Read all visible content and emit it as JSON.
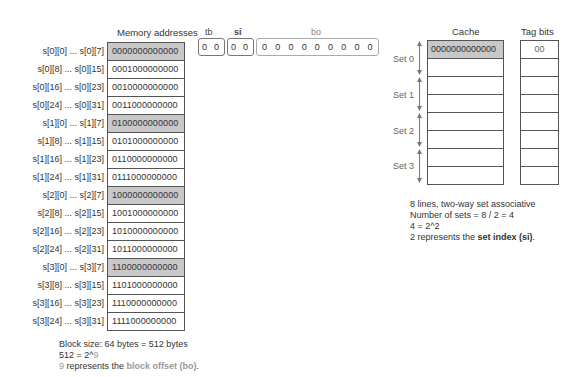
{
  "memory": {
    "title": "Memory addresses",
    "rows": [
      {
        "label": "s[0][0] ... s[0][7]",
        "address": "0000000000000",
        "highlight": true
      },
      {
        "label": "s[0][8] ... s[0][15]",
        "address": "0001000000000",
        "highlight": false
      },
      {
        "label": "s[0][16] ... s[0][23]",
        "address": "0010000000000",
        "highlight": false
      },
      {
        "label": "s[0][24] ... s[0][31]",
        "address": "0011000000000",
        "highlight": false
      },
      {
        "label": "s[1][0] ... s[1][7]",
        "address": "0100000000000",
        "highlight": true
      },
      {
        "label": "s[1][8] ... s[1][15]",
        "address": "0101000000000",
        "highlight": false
      },
      {
        "label": "s[1][16] ... s[1][23]",
        "address": "0110000000000",
        "highlight": false
      },
      {
        "label": "s[1][24] ... s[1][31]",
        "address": "0111000000000",
        "highlight": false
      },
      {
        "label": "s[2][0] ... s[2][7]",
        "address": "1000000000000",
        "highlight": true
      },
      {
        "label": "s[2][8] ... s[2][15]",
        "address": "1001000000000",
        "highlight": false
      },
      {
        "label": "s[2][16] ... s[2][23]",
        "address": "1010000000000",
        "highlight": false
      },
      {
        "label": "s[2][24] ... s[2][31]",
        "address": "1011000000000",
        "highlight": false
      },
      {
        "label": "s[3][0] ... s[3][7]",
        "address": "1100000000000",
        "highlight": true
      },
      {
        "label": "s[3][8] ... s[3][15]",
        "address": "1101000000000",
        "highlight": false
      },
      {
        "label": "s[3][16] ... s[3][23]",
        "address": "1110000000000",
        "highlight": false
      },
      {
        "label": "s[3][24] ... s[3][31]",
        "address": "1111000000000",
        "highlight": false
      }
    ],
    "notes": {
      "line1": "Block size: 64 bytes = 512 bytes",
      "line2_prefix": "512 = 2^",
      "line2_exp": "9",
      "line3_num": "9",
      "line3_text": " represents the ",
      "line3_term": "block offset (bo)",
      "line3_end": "."
    }
  },
  "address_fields": {
    "tb": {
      "label": "tb",
      "bits": [
        "0",
        "0"
      ]
    },
    "si": {
      "label": "si",
      "bits": [
        "0",
        "0"
      ]
    },
    "bo": {
      "label": "bo",
      "bits": [
        "0",
        "0",
        "0",
        "0",
        "0",
        "0",
        "0",
        "0",
        "0"
      ]
    }
  },
  "cache": {
    "title": "Cache",
    "lines": [
      "0000000000000",
      "",
      "",
      "",
      "",
      "",
      "",
      ""
    ],
    "sets": [
      "Set 0",
      "Set 1",
      "Set 2",
      "Set 3"
    ],
    "notes": {
      "line1": "8 lines, two-way set associative",
      "line2": "Number of sets = 8 / 2 = 4",
      "line3": "4 = 2^2",
      "line4_text": "2 represents the ",
      "line4_term": "set index (si)",
      "line4_end": "."
    }
  },
  "tag_bits": {
    "title": "Tag bits",
    "values": [
      "00",
      "",
      "",
      "",
      "",
      "",
      "",
      ""
    ]
  },
  "colors": {
    "highlight": "#c8c8c8",
    "border": "#555555",
    "muted": "#999999"
  }
}
